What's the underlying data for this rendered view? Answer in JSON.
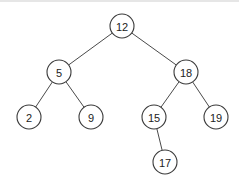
{
  "diagram": {
    "type": "binary-search-tree",
    "colors": {
      "stroke": "#3a3a3a",
      "fill": "#ffffff",
      "text": "#222222",
      "background": "#ffffff"
    },
    "nodes": [
      {
        "id": "n12",
        "label": "12",
        "x": 122,
        "y": 26
      },
      {
        "id": "n5",
        "label": "5",
        "x": 59,
        "y": 72
      },
      {
        "id": "n18",
        "label": "18",
        "x": 186,
        "y": 72
      },
      {
        "id": "n2",
        "label": "2",
        "x": 29,
        "y": 117
      },
      {
        "id": "n9",
        "label": "9",
        "x": 91,
        "y": 117
      },
      {
        "id": "n15",
        "label": "15",
        "x": 154,
        "y": 117
      },
      {
        "id": "n19",
        "label": "19",
        "x": 216,
        "y": 117
      },
      {
        "id": "n17",
        "label": "17",
        "x": 165,
        "y": 162
      }
    ],
    "edges": [
      {
        "from": "n12",
        "to": "n5"
      },
      {
        "from": "n12",
        "to": "n18"
      },
      {
        "from": "n5",
        "to": "n2"
      },
      {
        "from": "n5",
        "to": "n9"
      },
      {
        "from": "n18",
        "to": "n15"
      },
      {
        "from": "n18",
        "to": "n19"
      },
      {
        "from": "n15",
        "to": "n17"
      }
    ],
    "radius": 12
  }
}
